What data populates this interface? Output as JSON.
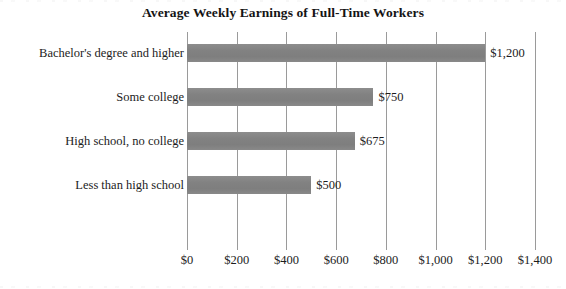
{
  "chart_data": {
    "type": "bar",
    "orientation": "horizontal",
    "title": "Average Weekly Earnings of Full-Time Workers",
    "xlabel": "",
    "ylabel": "",
    "categories": [
      "Bachelor's degree and higher",
      "Some college",
      "High school, no college",
      "Less than high school"
    ],
    "values": [
      1200,
      750,
      675,
      500
    ],
    "value_labels": [
      "$1,200",
      "$750",
      "$675",
      "$500"
    ],
    "xlim": [
      0,
      1400
    ],
    "xticks": [
      0,
      200,
      400,
      600,
      800,
      1000,
      1200,
      1400
    ],
    "xtick_labels": [
      "$0",
      "$200",
      "$400",
      "$600",
      "$800",
      "$1,000",
      "$1,200",
      "$1,400"
    ],
    "grid": "vertical",
    "legend": "none",
    "bar_color": "#858585",
    "gridline_color": "#9a9a9a",
    "background_color": "#ffffff",
    "text_color": "#1c1c1c"
  }
}
